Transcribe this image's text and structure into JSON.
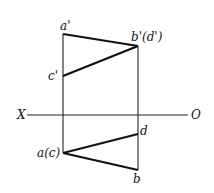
{
  "diagram": {
    "type": "orthographic-projection",
    "axis": {
      "left_label": "X",
      "right_label": "O"
    },
    "labels": {
      "a_prime": "a'",
      "b_prime_d_prime": "b'(d')",
      "c_prime": "c'",
      "a_c": "a(c)",
      "d": "d",
      "b": "b"
    }
  }
}
